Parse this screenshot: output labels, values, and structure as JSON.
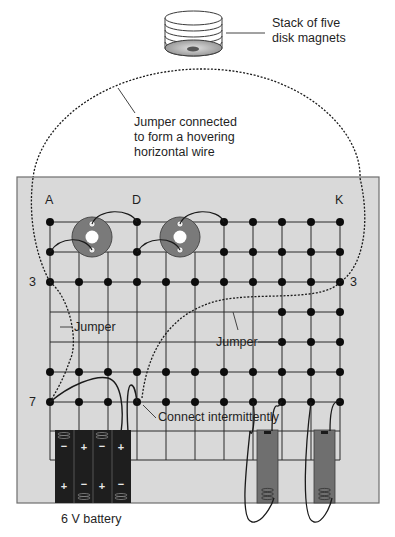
{
  "labels": {
    "magnet_stack": [
      "Stack of five",
      "disk magnets"
    ],
    "hover_jumper": [
      "Jumper connected",
      "to form a hovering",
      "horizontal wire"
    ],
    "jumper_left": "Jumper",
    "jumper_right": "Jumper",
    "connect": "Connect intermittently",
    "battery": "6 V battery",
    "col_a": "A",
    "col_d": "D",
    "col_k": "K",
    "row_3_left": "3",
    "row_3_right": "3",
    "row_7": "7"
  },
  "board": {
    "columns": [
      "A",
      "B",
      "C",
      "D",
      "E",
      "F",
      "G",
      "H",
      "I",
      "J",
      "K"
    ],
    "rows": [
      1,
      2,
      3,
      4,
      5,
      6,
      7
    ],
    "background": "#d9d9d9",
    "border": "#6e6e6e"
  },
  "components": {
    "magnet_stack": {
      "count": 5,
      "label_ref": "labels.magnet_stack"
    },
    "disk_magnets_on_board": 2,
    "battery_pack": {
      "cells": 4,
      "polarity_top": [
        "-",
        "+",
        "-",
        "+"
      ],
      "polarity_bottom": [
        "+",
        "-",
        "+",
        "-"
      ],
      "voltage": "6 V"
    },
    "single_cell_holders": 2
  },
  "colors": {
    "board": "#d9d9d9",
    "grid_line": "#2a2a2a",
    "dot": "#0d0d0d",
    "magnet_disk": "#7a7a7a",
    "battery_dark": "#1e1e1e",
    "cell_holder": "#6f6f6f"
  }
}
